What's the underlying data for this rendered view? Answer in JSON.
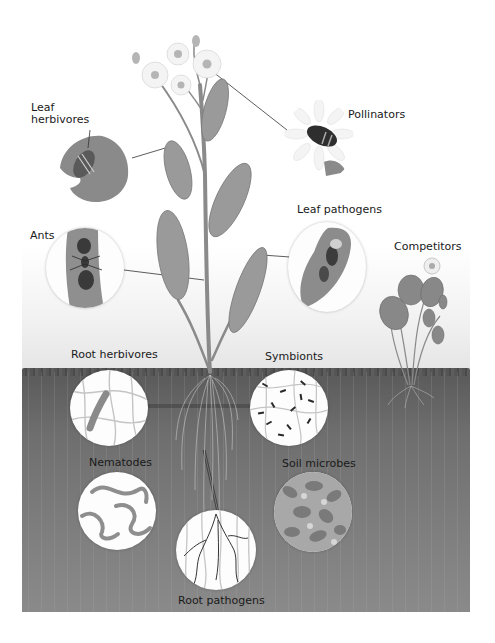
{
  "figure": {
    "type": "plant-interaction-diagram",
    "colors": {
      "background": "#ffffff",
      "sky_gradient_bottom": "#e6e6e6",
      "soil": "#6e6e6e",
      "soil_surface": "#4a4a4a",
      "plant": "#8c8c8c",
      "label_text": "#1a1a1a",
      "circle_fill": "#fdfdfd"
    },
    "above_ground": {
      "labels": {
        "leaf_herbivores_line1": "Leaf",
        "leaf_herbivores_line2": "herbivores",
        "pollinators": "Pollinators",
        "ants": "Ants",
        "leaf_pathogens": "Leaf pathogens",
        "competitors": "Competitors"
      }
    },
    "below_ground": {
      "labels": {
        "root_herbivores": "Root herbivores",
        "symbionts": "Symbionts",
        "nematodes": "Nematodes",
        "soil_microbes": "Soil microbes",
        "root_pathogens": "Root pathogens"
      }
    }
  }
}
